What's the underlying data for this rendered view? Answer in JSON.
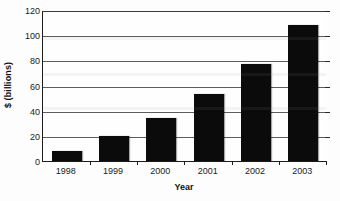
{
  "chart_data": {
    "type": "bar",
    "title": "",
    "subtitle": "",
    "xlabel": "Year",
    "ylabel": "$ (billions)",
    "categories": [
      "1998",
      "1999",
      "2000",
      "2001",
      "2002",
      "2003"
    ],
    "values": [
      8,
      20,
      34,
      53,
      77,
      108
    ],
    "series": [
      {
        "name": "",
        "values": [
          8,
          20,
          34,
          53,
          77,
          108
        ]
      }
    ],
    "ylim": [
      0,
      120
    ],
    "y_ticks": [
      0,
      20,
      40,
      60,
      80,
      100,
      120
    ],
    "y_tick_labels": [
      "0",
      "20",
      "40",
      "60",
      "80",
      "100",
      "120"
    ],
    "x_tick_labels": [
      "1998",
      "1999",
      "2000",
      "2001",
      "2002",
      "2003"
    ],
    "grid": true,
    "grid_axis": "y",
    "legend": false,
    "legend_position": "none",
    "bar_color": "#0b0b0b",
    "grid_color": "#5d5d5d",
    "axis_color": "#1c1c1c",
    "background_color": "#fefefe",
    "annotations": []
  }
}
